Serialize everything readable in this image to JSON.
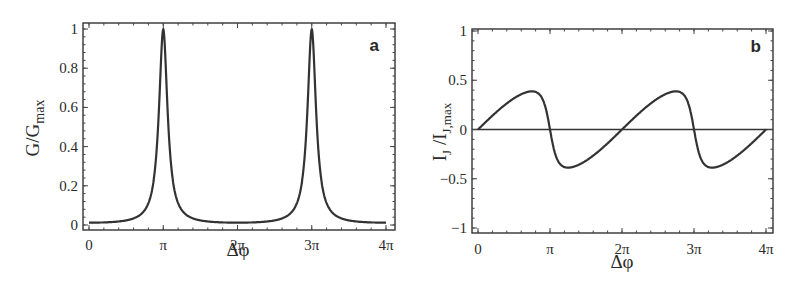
{
  "chart_data": [
    {
      "id": "a",
      "type": "line",
      "panel_label": "a",
      "title": "",
      "xlabel": "Δφ",
      "ylabel": "G/G_max",
      "ylabel_main": "G/G",
      "ylabel_sub": "max",
      "xlim": [
        0,
        12.566
      ],
      "ylim": [
        0,
        1
      ],
      "xticks": [
        0,
        3.1416,
        6.2832,
        9.4248,
        12.566
      ],
      "xtick_labels": [
        "0",
        "π",
        "2π",
        "3π",
        "4π"
      ],
      "yticks": [
        0,
        0.2,
        0.4,
        0.6,
        0.8,
        1
      ],
      "ytick_labels": [
        "0",
        "0.2",
        "0.4",
        "0.6",
        "0.8",
        "1"
      ],
      "grid": false,
      "legend": null,
      "description": "Sharp Lorentzian-like conductance peaks reaching 1 at Δφ = π and 3π; baseline ≈ 0.01 elsewhere",
      "series": [
        {
          "name": "G/G_max",
          "x": [
            0,
            0.785,
            1.571,
            2.356,
            2.749,
            2.945,
            3.063,
            3.1416,
            3.22,
            3.338,
            3.534,
            3.927,
            4.712,
            6.283,
            7.854,
            8.639,
            9.032,
            9.228,
            9.346,
            9.4248,
            9.503,
            9.621,
            9.817,
            10.21,
            10.996,
            12.566
          ],
          "y": [
            0.01,
            0.012,
            0.02,
            0.05,
            0.12,
            0.3,
            0.65,
            1.0,
            0.65,
            0.3,
            0.12,
            0.05,
            0.02,
            0.008,
            0.02,
            0.05,
            0.12,
            0.3,
            0.65,
            1.0,
            0.65,
            0.3,
            0.12,
            0.05,
            0.02,
            0.005
          ]
        }
      ]
    },
    {
      "id": "b",
      "type": "line",
      "panel_label": "b",
      "title": "",
      "xlabel": "Δφ",
      "ylabel": "I_J/I_J,max",
      "ylabel_main": "I",
      "ylabel_sub1": "J",
      "ylabel_mid": " /I",
      "ylabel_sub2": "J,max",
      "xlim": [
        0,
        12.566
      ],
      "ylim": [
        -1,
        1
      ],
      "xticks": [
        0,
        3.1416,
        6.2832,
        9.4248,
        12.566
      ],
      "xtick_labels": [
        "0",
        "π",
        "2π",
        "3π",
        "4π"
      ],
      "yticks": [
        -1,
        -0.5,
        0,
        0.5,
        1
      ],
      "ytick_labels": [
        "−1",
        "−0.5",
        "0",
        "0.5",
        "1"
      ],
      "grid": false,
      "zero_line": true,
      "legend": null,
      "description": "Sawtooth-like Josephson current-phase relation with 2π period: rises to ~0.96 near 0.85π, drops steeply through zero at π to ~−0.96 near 1.15π, rises back through zero at 2π",
      "series": [
        {
          "name": "I_J/I_J,max",
          "x": [
            0,
            0.5,
            1.0,
            1.571,
            2.0,
            2.4,
            2.67,
            2.83,
            2.95,
            3.05,
            3.1416,
            3.23,
            3.33,
            3.45,
            3.61,
            3.88,
            4.28,
            4.712,
            5.3,
            5.8,
            6.2832,
            6.78,
            7.28,
            7.85,
            8.28,
            8.68,
            8.95,
            9.11,
            9.23,
            9.33,
            9.4248,
            9.52,
            9.62,
            9.74,
            9.9,
            10.17,
            10.57,
            10.996,
            11.6,
            12.1,
            12.566
          ],
          "y": [
            0,
            0.2,
            0.4,
            0.6,
            0.74,
            0.88,
            0.95,
            0.96,
            0.9,
            0.6,
            0,
            -0.6,
            -0.9,
            -0.96,
            -0.95,
            -0.88,
            -0.74,
            -0.6,
            -0.4,
            -0.2,
            0,
            0.2,
            0.4,
            0.6,
            0.74,
            0.88,
            0.95,
            0.96,
            0.9,
            0.6,
            0,
            -0.6,
            -0.9,
            -0.96,
            -0.95,
            -0.88,
            -0.74,
            -0.6,
            -0.4,
            -0.2,
            0
          ]
        }
      ]
    }
  ]
}
